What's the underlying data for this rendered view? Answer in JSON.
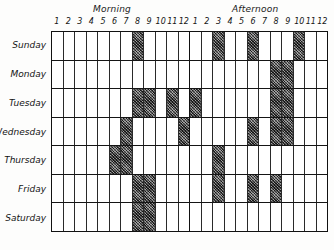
{
  "chart_data": {
    "type": "heatmap",
    "xlabel": "",
    "ylabel": "",
    "grid": true,
    "legend": "none",
    "sections": [
      "Morning",
      "Afternoon"
    ],
    "x": [
      "1",
      "2",
      "3",
      "4",
      "5",
      "6",
      "7",
      "8",
      "9",
      "10",
      "11",
      "12",
      "1",
      "2",
      "3",
      "4",
      "5",
      "6",
      "7",
      "8",
      "9",
      "10",
      "11",
      "12"
    ],
    "categories": [
      "Sunday",
      "Monday",
      "Tuesday",
      "Wednesday",
      "Thursday",
      "Friday",
      "Saturday"
    ],
    "values": [
      [
        0,
        0,
        0,
        0,
        0,
        0,
        0,
        1,
        0,
        0,
        0,
        0,
        0,
        0,
        1,
        0,
        0,
        1,
        0,
        0,
        0,
        1,
        0,
        0
      ],
      [
        0,
        0,
        0,
        0,
        0,
        0,
        0,
        0,
        0,
        0,
        0,
        0,
        0,
        0,
        0,
        0,
        0,
        0,
        0,
        1,
        1,
        0,
        0,
        0
      ],
      [
        0,
        0,
        0,
        0,
        0,
        0,
        0,
        1,
        1,
        0,
        1,
        0,
        1,
        0,
        0,
        0,
        0,
        0,
        0,
        1,
        1,
        0,
        0,
        0
      ],
      [
        0,
        0,
        0,
        0,
        0,
        0,
        1,
        0,
        0,
        0,
        0,
        1,
        0,
        0,
        0,
        0,
        0,
        1,
        0,
        1,
        1,
        0,
        0,
        0
      ],
      [
        0,
        0,
        0,
        0,
        0,
        1,
        1,
        0,
        0,
        0,
        0,
        0,
        0,
        0,
        1,
        0,
        0,
        0,
        0,
        0,
        0,
        0,
        0,
        0
      ],
      [
        0,
        0,
        0,
        0,
        0,
        0,
        0,
        1,
        1,
        0,
        0,
        0,
        0,
        0,
        1,
        0,
        0,
        1,
        0,
        1,
        0,
        0,
        0,
        0
      ],
      [
        0,
        0,
        0,
        0,
        0,
        0,
        0,
        1,
        1,
        0,
        0,
        0,
        0,
        0,
        0,
        0,
        0,
        0,
        0,
        0,
        0,
        0,
        0,
        0
      ]
    ],
    "filled_label": "shaded",
    "empty_label": "blank"
  },
  "captions": {
    "morning": "Morning",
    "afternoon": "Afternoon"
  },
  "hours": [
    "1",
    "2",
    "3",
    "4",
    "5",
    "6",
    "7",
    "8",
    "9",
    "10",
    "11",
    "12",
    "1",
    "2",
    "3",
    "4",
    "5",
    "6",
    "7",
    "8",
    "9",
    "10",
    "11",
    "12"
  ],
  "days": [
    "Sunday",
    "Monday",
    "Tuesday",
    "Wednesday",
    "Thursday",
    "Friday",
    "Saturday"
  ],
  "colors": {
    "ink": "#141414",
    "grid_line": "#2a2a2a",
    "border": "#111111",
    "fill": "#565656",
    "paper": "#fdfdfc"
  }
}
